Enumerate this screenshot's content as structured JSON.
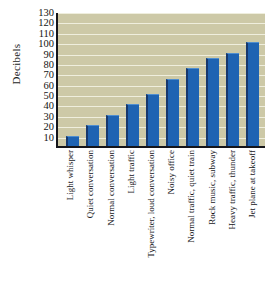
{
  "chart_data": {
    "type": "bar",
    "title": "",
    "xlabel": "",
    "ylabel": "Decibels",
    "ylim": [
      0,
      130
    ],
    "yticks": [
      130,
      120,
      110,
      100,
      90,
      80,
      70,
      60,
      50,
      40,
      30,
      20,
      10
    ],
    "grid": true,
    "legend": null,
    "categories": [
      "Light whisper",
      "Quiet conversation",
      "Normal conversation",
      "Light traffic",
      "Typewriter, loud conversation",
      "Noisy office",
      "Normal traffic, quiet train",
      "Rock music, subway",
      "Heavy traffic, thunder",
      "Jet plane at takeoff"
    ],
    "values": [
      10,
      20,
      30,
      40,
      50,
      65,
      75,
      85,
      90,
      100
    ],
    "colors": {
      "bar": "#1f63b2",
      "bar_edge": "#17386d",
      "plot_background": "#cdc9a7",
      "gridline": "#efeedd",
      "axis": "#15151a",
      "text": "#16161a",
      "page_background": "#ffffff"
    }
  }
}
